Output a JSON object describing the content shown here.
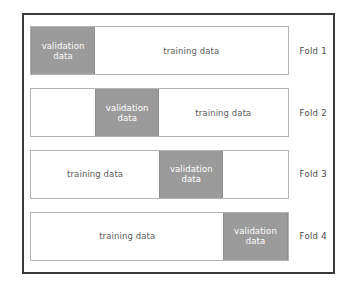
{
  "diagram": {
    "type": "k-fold-cross-validation",
    "folds": [
      {
        "label": "Fold 1",
        "segments": [
          {
            "kind": "validation",
            "text": "validation\ndata",
            "width_pct": 25
          },
          {
            "kind": "training",
            "text": "training data",
            "width_pct": 75
          }
        ]
      },
      {
        "label": "Fold 2",
        "segments": [
          {
            "kind": "blank",
            "text": "",
            "width_pct": 25
          },
          {
            "kind": "validation",
            "text": "validation\ndata",
            "width_pct": 25
          },
          {
            "kind": "training",
            "text": "training data",
            "width_pct": 50
          }
        ]
      },
      {
        "label": "Fold 3",
        "segments": [
          {
            "kind": "training",
            "text": "training data",
            "width_pct": 50
          },
          {
            "kind": "validation",
            "text": "validation\ndata",
            "width_pct": 25
          },
          {
            "kind": "blank",
            "text": "",
            "width_pct": 25
          }
        ]
      },
      {
        "label": "Fold 4",
        "segments": [
          {
            "kind": "training",
            "text": "training data",
            "width_pct": 75
          },
          {
            "kind": "validation",
            "text": "validation\ndata",
            "width_pct": 25
          }
        ]
      }
    ],
    "colors": {
      "validation_fill": "#9b9b9b",
      "validation_text": "#ffffff",
      "training_text": "#5c5c5c",
      "bar_border": "#b4b4b4",
      "frame_border": "#3a3a3a",
      "background": "#ffffff",
      "label_text": "#4a4a4a"
    }
  }
}
